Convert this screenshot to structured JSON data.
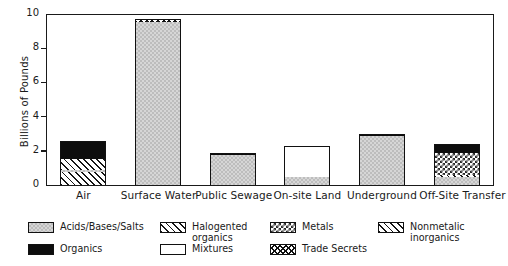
{
  "chart_data": {
    "type": "bar",
    "subtype": "stacked-bar",
    "title": "",
    "xlabel": "",
    "ylabel": "Billions of Pounds",
    "ylim": [
      0,
      10
    ],
    "yticks": [
      0,
      2,
      4,
      6,
      8,
      10
    ],
    "grid": false,
    "legend_position": "bottom",
    "categories": [
      "Air",
      "Surface Water",
      "Public Sewage",
      "On-site Land",
      "Underground",
      "Off-Site Transfer"
    ],
    "series": [
      {
        "name": "Acids/Bases/Salts",
        "key": "acids",
        "values": [
          0.15,
          9.55,
          1.75,
          0.45,
          2.85,
          0.45
        ]
      },
      {
        "name": "Halogented organics",
        "key": "halo",
        "values": [
          0.6,
          0.0,
          0.0,
          0.0,
          0.0,
          0.0
        ]
      },
      {
        "name": "Metals",
        "key": "metals",
        "values": [
          0.0,
          0.0,
          0.0,
          0.0,
          0.0,
          1.3
        ]
      },
      {
        "name": "Nonmetalic inorganics",
        "key": "nonmetallic",
        "values": [
          0.75,
          0.0,
          0.0,
          0.0,
          0.0,
          0.15
        ]
      },
      {
        "name": "Organics",
        "key": "organics",
        "values": [
          1.1,
          0.0,
          0.15,
          0.0,
          0.12,
          0.5
        ]
      },
      {
        "name": "Mixtures",
        "key": "mixtures",
        "values": [
          0.0,
          0.0,
          0.0,
          1.85,
          0.0,
          0.0
        ]
      },
      {
        "name": "Trade Secrets",
        "key": "trade",
        "values": [
          0.0,
          0.15,
          0.0,
          0.0,
          0.0,
          0.0
        ]
      }
    ],
    "totals": [
      2.6,
      9.7,
      1.9,
      2.3,
      2.97,
      2.4
    ],
    "stack_order": [
      [
        "nonmetallic",
        "acids",
        "halo",
        "organics"
      ],
      [
        "acids",
        "trade"
      ],
      [
        "acids",
        "organics"
      ],
      [
        "acids",
        "mixtures"
      ],
      [
        "acids",
        "organics"
      ],
      [
        "acids",
        "nonmetallic",
        "metals",
        "organics"
      ]
    ]
  },
  "axis": {
    "y_title": "Billions of Pounds",
    "y_tick_labels": [
      "0",
      "2",
      "4",
      "6",
      "8",
      "10"
    ]
  },
  "legend": {
    "entries": [
      {
        "label": "Acids/Bases/Salts",
        "pattern": "acids"
      },
      {
        "label": "Halogented organics",
        "pattern": "halo"
      },
      {
        "label": "Metals",
        "pattern": "metals"
      },
      {
        "label": "Nonmetalic inorganics",
        "pattern": "nonmetallic"
      },
      {
        "label": "Organics",
        "pattern": "organics"
      },
      {
        "label": "Mixtures",
        "pattern": "mixtures"
      },
      {
        "label": "Trade Secrets",
        "pattern": "trade"
      }
    ]
  },
  "colors": {
    "ink": "#1a1a1a",
    "acids_fill": "#d6d6d6",
    "organics_fill": "#0d0d0d",
    "background": "#ffffff"
  }
}
